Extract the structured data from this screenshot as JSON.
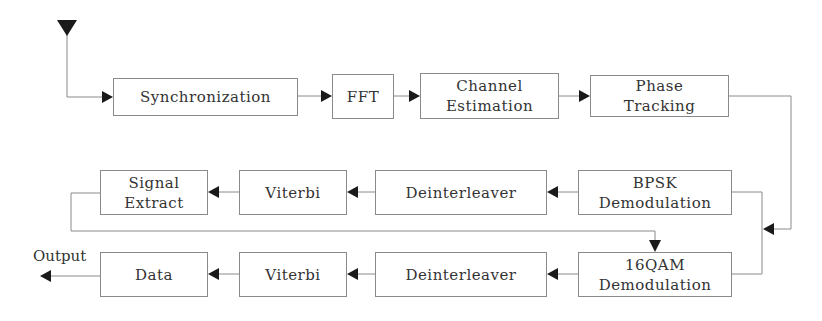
{
  "diagram": {
    "type": "block-diagram",
    "title": "",
    "colors": {
      "line": "#8a8a8a",
      "arrow": "#1a1a1a",
      "text": "#333333",
      "background": "#ffffff"
    },
    "input": {
      "icon": "antenna-triangle-icon"
    },
    "blocks": {
      "synchronization": {
        "lines": [
          "Synchronization"
        ]
      },
      "fft": {
        "lines": [
          "FFT"
        ]
      },
      "channel_estimation": {
        "lines": [
          "Channel",
          "Estimation"
        ]
      },
      "phase_tracking": {
        "lines": [
          "Phase",
          "Tracking"
        ]
      },
      "bpsk_demod": {
        "lines": [
          "BPSK",
          "Demodulation"
        ]
      },
      "deinterleaver_top": {
        "lines": [
          "Deinterleaver"
        ]
      },
      "viterbi_top": {
        "lines": [
          "Viterbi"
        ]
      },
      "signal_extract": {
        "lines": [
          "Signal",
          "Extract"
        ]
      },
      "qam16_demod": {
        "lines": [
          "16QAM",
          "Demodulation"
        ]
      },
      "deinterleaver_bottom": {
        "lines": [
          "Deinterleaver"
        ]
      },
      "viterbi_bottom": {
        "lines": [
          "Viterbi"
        ]
      },
      "data": {
        "lines": [
          "Data"
        ]
      }
    },
    "output_label": "Output",
    "edges": [
      [
        "input",
        "synchronization"
      ],
      [
        "synchronization",
        "fft"
      ],
      [
        "fft",
        "channel_estimation"
      ],
      [
        "channel_estimation",
        "phase_tracking"
      ],
      [
        "phase_tracking",
        "bpsk_demod"
      ],
      [
        "phase_tracking",
        "qam16_demod"
      ],
      [
        "bpsk_demod",
        "deinterleaver_top"
      ],
      [
        "deinterleaver_top",
        "viterbi_top"
      ],
      [
        "viterbi_top",
        "signal_extract"
      ],
      [
        "signal_extract",
        "qam16_demod"
      ],
      [
        "qam16_demod",
        "deinterleaver_bottom"
      ],
      [
        "deinterleaver_bottom",
        "viterbi_bottom"
      ],
      [
        "viterbi_bottom",
        "data"
      ],
      [
        "data",
        "output"
      ]
    ]
  }
}
